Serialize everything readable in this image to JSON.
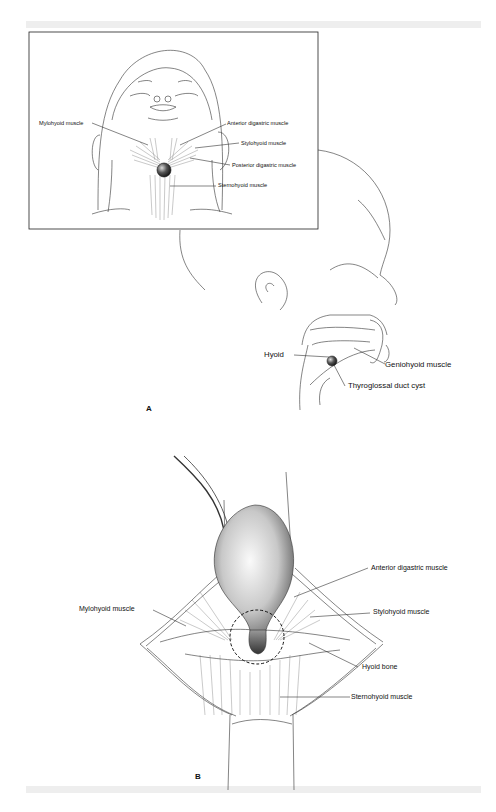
{
  "figure": {
    "panel_a": {
      "letter": "A",
      "inset_labels": {
        "mylohyoid": "Mylohyoid muscle",
        "anterior_digastric": "Anterior digastric muscle",
        "stylohyoid": "Stylohyoid muscle",
        "posterior_digastric": "Posterior digastric muscle",
        "sternohyoid": "Sternohyoid muscle"
      },
      "profile_labels": {
        "hyoid": "Hyoid",
        "geniohyoid": "Geniohyoid muscle",
        "cyst": "Thyroglossal duct cyst"
      }
    },
    "panel_b": {
      "letter": "B",
      "labels": {
        "anterior_digastric": "Anterior digastric muscle",
        "mylohyoid": "Mylohyoid muscle",
        "stylohyoid": "Stylohyoid muscle",
        "hyoid_bone": "Hyoid bone",
        "sternohyoid": "Sternohyoid muscle"
      }
    }
  }
}
